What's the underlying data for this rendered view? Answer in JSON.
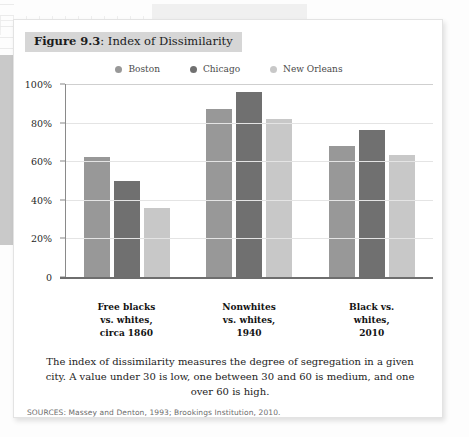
{
  "figure": {
    "number_label": "Figure 9.3",
    "title_separator": ": ",
    "title": "Index of Dissimilarity"
  },
  "caption": "The index of dissimilarity measures the degree of segregation in a given city. A value under 30 is low, one between 30 and 60 is medium, and one over 60 is high.",
  "sources": "SOURCES: Massey and Denton, 1993; Brookings Institution, 2010.",
  "colors": {
    "boston": "#989898",
    "chicago": "#707070",
    "new_orleans": "#c8c8c8",
    "banner_bg": "#d6d6d6",
    "gridline": "#e4e4e4",
    "axis": "#6e6e6e",
    "card_bg": "#ffffff"
  },
  "chart_data": {
    "type": "bar",
    "title": "Index of Dissimilarity",
    "xlabel": "",
    "ylabel": "",
    "ylim": [
      0,
      100
    ],
    "grid": true,
    "legend_position": "top-center",
    "ytick_labels": [
      "100%",
      "80%",
      "60%",
      "40%",
      "20%",
      "0"
    ],
    "ytick_values": [
      100,
      80,
      60,
      40,
      20,
      0
    ],
    "categories": [
      "Free blacks\nvs. whites,\ncirca 1860",
      "Nonwhites\nvs. whites,\n1940",
      "Black vs.\nwhites,\n2010"
    ],
    "category_lines": [
      [
        "Free blacks",
        "vs. whites,",
        "circa 1860"
      ],
      [
        "Nonwhites",
        "vs. whites,",
        "1940"
      ],
      [
        "Black vs.",
        "whites,",
        "2010"
      ]
    ],
    "series": [
      {
        "name": "Boston",
        "color": "#989898",
        "values": [
          62,
          87,
          68
        ]
      },
      {
        "name": "Chicago",
        "color": "#707070",
        "values": [
          50,
          96,
          76
        ]
      },
      {
        "name": "New Orleans",
        "color": "#c8c8c8",
        "values": [
          36,
          82,
          63
        ]
      }
    ]
  }
}
